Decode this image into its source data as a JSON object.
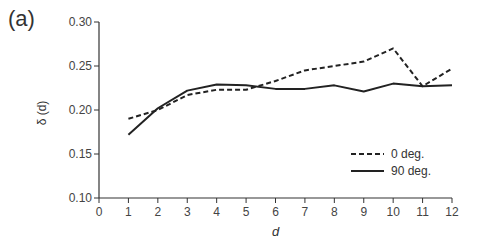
{
  "panel_label": "(a)",
  "chart_data": {
    "type": "line",
    "title": "",
    "xlabel": "d",
    "ylabel": "δ (d)",
    "xlim": [
      0,
      12
    ],
    "ylim": [
      0.1,
      0.3
    ],
    "x_ticks": [
      "0",
      "1",
      "2",
      "3",
      "4",
      "5",
      "6",
      "7",
      "8",
      "9",
      "10",
      "11",
      "12"
    ],
    "y_ticks": [
      "0.10",
      "0.15",
      "0.20",
      "0.25",
      "0.30"
    ],
    "grid": false,
    "legend_position": "lower right",
    "x": [
      1,
      2,
      3,
      4,
      5,
      6,
      7,
      8,
      9,
      10,
      11,
      12
    ],
    "series": [
      {
        "name": "0 deg.",
        "style": "dashed",
        "values": [
          0.19,
          0.2,
          0.217,
          0.223,
          0.223,
          0.233,
          0.245,
          0.25,
          0.255,
          0.27,
          0.227,
          0.247
        ]
      },
      {
        "name": "90 deg.",
        "style": "solid",
        "values": [
          0.172,
          0.202,
          0.222,
          0.229,
          0.228,
          0.224,
          0.224,
          0.228,
          0.221,
          0.23,
          0.227,
          0.228
        ]
      }
    ]
  }
}
